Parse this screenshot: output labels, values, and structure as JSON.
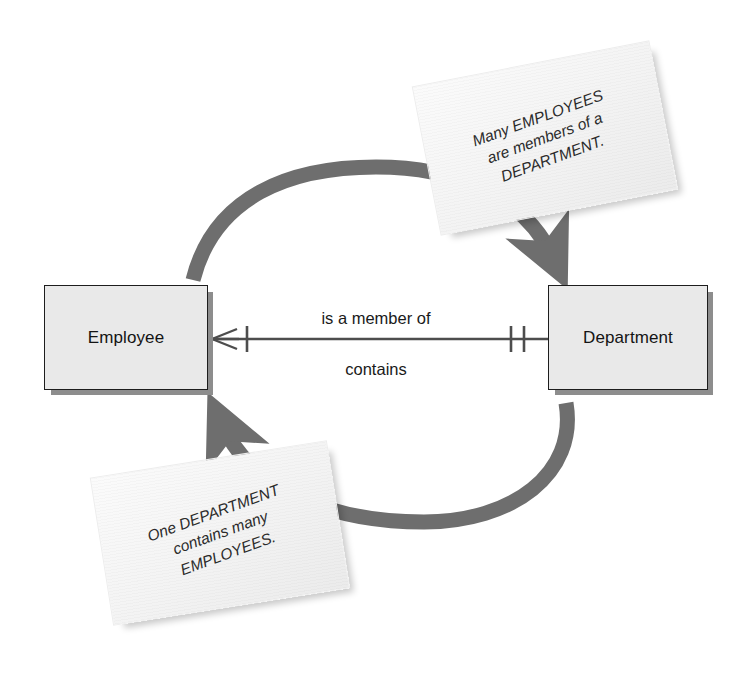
{
  "diagram": {
    "type": "crows-foot-er-diagram",
    "colors": {
      "entity_fill": "#e9e9e9",
      "entity_border": "#1d1d1d",
      "entity_shadow": "#8d8d8d",
      "arc": "#6e6e6e",
      "relationship_line": "#4d4d4d",
      "note_fill": "#f5f5f5",
      "text": "#1a1a1a",
      "background": "#ffffff"
    }
  },
  "entities": [
    {
      "id": "employee",
      "label": "Employee"
    },
    {
      "id": "department",
      "label": "Department"
    }
  ],
  "relationship": {
    "label_forward": "is a member of",
    "label_reverse": "contains",
    "employee_end": {
      "cardinality": "many",
      "notation": "crows-foot-with-one-tick",
      "reads": "many"
    },
    "department_end": {
      "cardinality": "one-and-only-one",
      "notation": "double-tick",
      "reads": "exactly one"
    }
  },
  "notes": [
    {
      "id": "note-top",
      "lines": [
        "Many EMPLOYEES",
        "are members of a",
        "DEPARTMENT."
      ],
      "text": "Many EMPLOYEES\nare members of a\nDEPARTMENT.",
      "points_to": "department"
    },
    {
      "id": "note-bottom",
      "lines": [
        "One DEPARTMENT",
        "contains many",
        "EMPLOYEES."
      ],
      "text": "One DEPARTMENT\ncontains many\nEMPLOYEES.",
      "points_to": "employee"
    }
  ],
  "arrows": [
    {
      "id": "arc-top",
      "from": "employee",
      "to": "department",
      "direction": "clockwise-over-the-top"
    },
    {
      "id": "arc-bottom",
      "from": "department",
      "to": "employee",
      "direction": "clockwise-under-the-bottom"
    }
  ]
}
